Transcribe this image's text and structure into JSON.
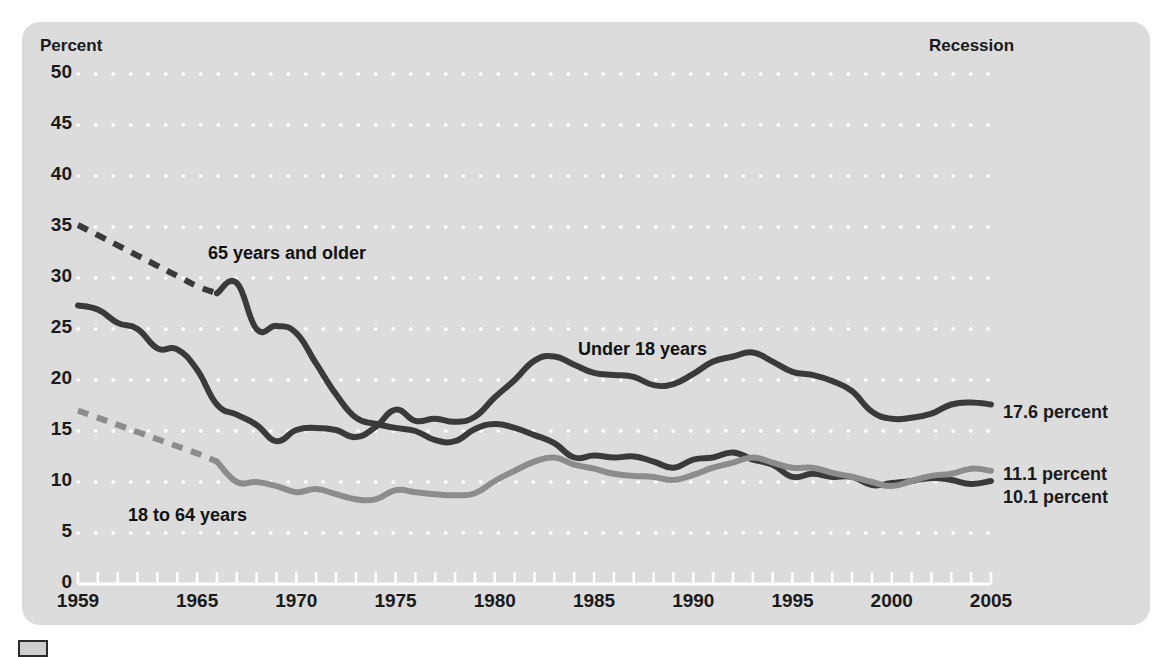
{
  "figure": {
    "axis_title": "Percent",
    "recession_label": "Recession",
    "background_color": "#dcdcdc",
    "series_dark_color": "#3a3a3a",
    "series_gray_color": "#8c8c8c"
  },
  "series_labels": {
    "older": "65 years and older",
    "under18": "Under 18 years",
    "adults": "18 to 64 years"
  },
  "end_labels": {
    "under18": "17.6 percent",
    "adults": "11.1 percent",
    "older": "10.1 percent"
  },
  "chart_data": {
    "type": "line",
    "title": "Percent",
    "xlabel": "",
    "ylabel": "Percent",
    "xlim": [
      1959,
      2005
    ],
    "ylim": [
      0,
      50
    ],
    "grid": true,
    "legend": "inline annotations",
    "ytick_labels": [
      "50",
      "45",
      "40",
      "35",
      "30",
      "25",
      "20",
      "15",
      "10",
      "5",
      "0"
    ],
    "ytick_values": [
      50,
      45,
      40,
      35,
      30,
      25,
      20,
      15,
      10,
      5,
      0
    ],
    "xtick_labels": [
      "1959",
      "1965",
      "1970",
      "1975",
      "1980",
      "1985",
      "1990",
      "1995",
      "2000",
      "2005"
    ],
    "xtick_values": [
      1959,
      1965,
      1970,
      1975,
      1980,
      1985,
      1990,
      1995,
      2000,
      2005
    ],
    "minor_xticks": "every year 1959-2005",
    "series": [
      {
        "name": "65 years and older",
        "color": "#3a3a3a",
        "end_value": 10.1,
        "dashed_segment": {
          "x": [
            1959,
            1966
          ],
          "y": [
            35.2,
            28.5
          ]
        },
        "x": [
          1959,
          1960,
          1961,
          1962,
          1963,
          1964,
          1965,
          1966,
          1967,
          1968,
          1969,
          1970,
          1971,
          1972,
          1973,
          1974,
          1975,
          1976,
          1977,
          1978,
          1979,
          1980,
          1981,
          1982,
          1983,
          1984,
          1985,
          1986,
          1987,
          1988,
          1989,
          1990,
          1991,
          1992,
          1993,
          1994,
          1995,
          1996,
          1997,
          1998,
          1999,
          2000,
          2001,
          2002,
          2003,
          2004,
          2005
        ],
        "y": [
          35.2,
          34.2,
          33.2,
          32.2,
          31.2,
          30.2,
          29.2,
          28.5,
          29.5,
          25.0,
          25.3,
          24.6,
          21.6,
          18.6,
          16.3,
          15.7,
          15.3,
          15.0,
          14.1,
          14.0,
          15.2,
          15.7,
          15.3,
          14.6,
          13.8,
          12.4,
          12.6,
          12.4,
          12.5,
          12.0,
          11.4,
          12.2,
          12.4,
          12.9,
          12.2,
          11.7,
          10.5,
          10.8,
          10.5,
          10.5,
          9.7,
          9.9,
          10.1,
          10.4,
          10.2,
          9.8,
          10.1
        ]
      },
      {
        "name": "Under 18 years",
        "color": "#3a3a3a",
        "end_value": 17.6,
        "x": [
          1959,
          1960,
          1961,
          1962,
          1963,
          1964,
          1965,
          1966,
          1967,
          1968,
          1969,
          1970,
          1971,
          1972,
          1973,
          1974,
          1975,
          1976,
          1977,
          1978,
          1979,
          1980,
          1981,
          1982,
          1983,
          1984,
          1985,
          1986,
          1987,
          1988,
          1989,
          1990,
          1991,
          1992,
          1993,
          1994,
          1995,
          1996,
          1997,
          1998,
          1999,
          2000,
          2001,
          2002,
          2003,
          2004,
          2005
        ],
        "y": [
          27.3,
          26.9,
          25.6,
          25.0,
          23.1,
          23.0,
          21.0,
          17.6,
          16.6,
          15.6,
          14.0,
          15.1,
          15.3,
          15.1,
          14.4,
          15.4,
          17.1,
          16.0,
          16.2,
          15.9,
          16.4,
          18.3,
          20.0,
          21.9,
          22.3,
          21.5,
          20.7,
          20.5,
          20.3,
          19.5,
          19.6,
          20.6,
          21.8,
          22.3,
          22.7,
          21.8,
          20.8,
          20.5,
          19.9,
          18.9,
          16.9,
          16.2,
          16.3,
          16.7,
          17.6,
          17.8,
          17.6
        ]
      },
      {
        "name": "18 to 64 years",
        "color": "#8c8c8c",
        "end_value": 11.1,
        "dashed_segment": {
          "x": [
            1959,
            1966
          ],
          "y": [
            17.0,
            12.0
          ]
        },
        "x": [
          1959,
          1960,
          1961,
          1962,
          1963,
          1964,
          1965,
          1966,
          1967,
          1968,
          1969,
          1970,
          1971,
          1972,
          1973,
          1974,
          1975,
          1976,
          1977,
          1978,
          1979,
          1980,
          1981,
          1982,
          1983,
          1984,
          1985,
          1986,
          1987,
          1988,
          1989,
          1990,
          1991,
          1992,
          1993,
          1994,
          1995,
          1996,
          1997,
          1998,
          1999,
          2000,
          2001,
          2002,
          2003,
          2004,
          2005
        ],
        "y": [
          17.0,
          16.3,
          15.6,
          14.9,
          14.2,
          13.5,
          12.8,
          12.0,
          10.0,
          10.0,
          9.6,
          9.0,
          9.3,
          8.8,
          8.3,
          8.3,
          9.2,
          9.0,
          8.8,
          8.7,
          8.9,
          10.1,
          11.1,
          12.0,
          12.4,
          11.7,
          11.3,
          10.8,
          10.6,
          10.5,
          10.2,
          10.7,
          11.4,
          11.9,
          12.4,
          11.9,
          11.4,
          11.4,
          10.9,
          10.5,
          10.0,
          9.6,
          10.1,
          10.6,
          10.8,
          11.3,
          11.1
        ]
      }
    ]
  }
}
